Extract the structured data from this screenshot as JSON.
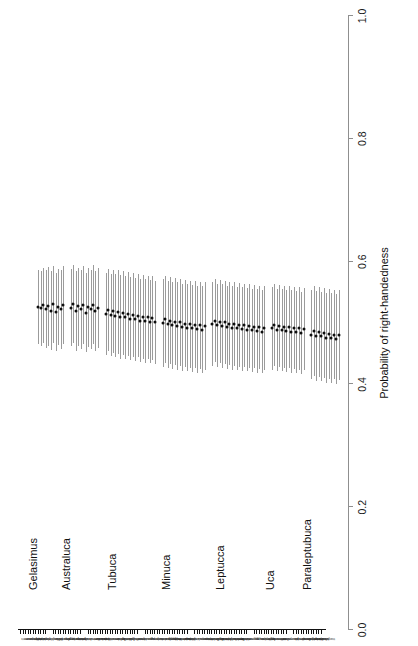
{
  "figure": {
    "type": "forest-plot",
    "orientation": "rotated-90"
  },
  "chart_data": {
    "type": "scatter",
    "title": "",
    "subtitle": "",
    "xlabel": "Probability of right-handedness",
    "ylabel": "",
    "xlim": [
      0.0,
      1.0
    ],
    "xticks": [
      "0.0",
      "0.2",
      "0.4",
      "0.6",
      "0.8",
      "1.0"
    ],
    "xtickvalues": [
      0.0,
      0.2,
      0.4,
      0.6,
      0.8,
      1.0
    ],
    "grid": false,
    "legend": null,
    "reference_line": null,
    "point_color": "#0d0d0d",
    "errorbar_color": "#9b9b9b",
    "axis_color": "#8f8f8f",
    "marker": "point-estimate-with-credible-interval",
    "n_species": 110,
    "groups": [
      {
        "name": "Gelasimus",
        "n": 11,
        "species": [
          {
            "label": "vomeris",
            "value": 0.5,
            "low": 0.44,
            "high": 0.56
          },
          {
            "label": "vocans",
            "value": 0.498,
            "low": 0.437,
            "high": 0.559
          },
          {
            "label": "tetragonon",
            "value": 0.503,
            "low": 0.441,
            "high": 0.564
          },
          {
            "label": "hesperiae",
            "value": 0.497,
            "low": 0.433,
            "high": 0.56
          },
          {
            "label": "jocelynae",
            "value": 0.501,
            "low": 0.436,
            "high": 0.565
          },
          {
            "label": "dampieri",
            "value": 0.494,
            "low": 0.43,
            "high": 0.558
          },
          {
            "label": "borealis",
            "value": 0.505,
            "low": 0.442,
            "high": 0.567
          },
          {
            "label": "excisa",
            "value": 0.492,
            "low": 0.428,
            "high": 0.556
          },
          {
            "label": "elegans",
            "value": 0.5,
            "low": 0.438,
            "high": 0.562
          },
          {
            "label": "neocultrimana",
            "value": 0.496,
            "low": 0.431,
            "high": 0.56
          },
          {
            "label": "longidigita",
            "value": 0.503,
            "low": 0.439,
            "high": 0.566
          }
        ]
      },
      {
        "name": "Australuca",
        "n": 12,
        "species": [
          {
            "label": "bellator",
            "value": 0.499,
            "low": 0.436,
            "high": 0.562
          },
          {
            "label": "polita",
            "value": 0.505,
            "low": 0.441,
            "high": 0.569
          },
          {
            "label": "seismella",
            "value": 0.494,
            "low": 0.429,
            "high": 0.558
          },
          {
            "label": "elegans",
            "value": 0.501,
            "low": 0.437,
            "high": 0.564
          },
          {
            "label": "perplexa",
            "value": 0.497,
            "low": 0.432,
            "high": 0.561
          },
          {
            "label": "signata",
            "value": 0.503,
            "low": 0.44,
            "high": 0.566
          },
          {
            "label": "mjoebergi",
            "value": 0.491,
            "low": 0.426,
            "high": 0.556
          },
          {
            "label": "hirsutimanus",
            "value": 0.5,
            "low": 0.435,
            "high": 0.564
          },
          {
            "label": "crassipes",
            "value": 0.496,
            "low": 0.431,
            "high": 0.561
          },
          {
            "label": "tomentosa",
            "value": 0.504,
            "low": 0.439,
            "high": 0.568
          },
          {
            "label": "triangularis",
            "value": 0.493,
            "low": 0.428,
            "high": 0.558
          },
          {
            "label": "annulipes",
            "value": 0.499,
            "low": 0.434,
            "high": 0.563
          }
        ]
      },
      {
        "name": "Tubuca",
        "n": 21,
        "species": [
          {
            "label": "flammula",
            "value": 0.489,
            "low": 0.422,
            "high": 0.556
          },
          {
            "label": "paradussumieri",
            "value": 0.495,
            "low": 0.428,
            "high": 0.562
          },
          {
            "label": "dussumieri",
            "value": 0.487,
            "low": 0.42,
            "high": 0.554
          },
          {
            "label": "acuta",
            "value": 0.493,
            "low": 0.425,
            "high": 0.561
          },
          {
            "label": "arcuata",
            "value": 0.486,
            "low": 0.418,
            "high": 0.554
          },
          {
            "label": "forcipata",
            "value": 0.492,
            "low": 0.424,
            "high": 0.56
          },
          {
            "label": "rosea",
            "value": 0.484,
            "low": 0.416,
            "high": 0.552
          },
          {
            "label": "urvillei",
            "value": 0.49,
            "low": 0.422,
            "high": 0.558
          },
          {
            "label": "coarctata",
            "value": 0.483,
            "low": 0.415,
            "high": 0.551
          },
          {
            "label": "demani",
            "value": 0.489,
            "low": 0.421,
            "high": 0.557
          },
          {
            "label": "capricornis",
            "value": 0.481,
            "low": 0.413,
            "high": 0.549
          },
          {
            "label": "bellator",
            "value": 0.487,
            "low": 0.419,
            "high": 0.555
          },
          {
            "label": "elegans",
            "value": 0.48,
            "low": 0.412,
            "high": 0.548
          },
          {
            "label": "australiae",
            "value": 0.486,
            "low": 0.418,
            "high": 0.554
          },
          {
            "label": "alcocki",
            "value": 0.478,
            "low": 0.41,
            "high": 0.546
          },
          {
            "label": "typhoni",
            "value": 0.484,
            "low": 0.416,
            "high": 0.552
          },
          {
            "label": "polita",
            "value": 0.477,
            "low": 0.409,
            "high": 0.545
          },
          {
            "label": "hirsutimana",
            "value": 0.483,
            "low": 0.415,
            "high": 0.551
          },
          {
            "label": "paradussumieri2",
            "value": 0.476,
            "low": 0.408,
            "high": 0.544
          },
          {
            "label": "seismella",
            "value": 0.482,
            "low": 0.414,
            "high": 0.55
          },
          {
            "label": "signata",
            "value": 0.475,
            "low": 0.407,
            "high": 0.543
          }
        ]
      },
      {
        "name": "Minuca",
        "n": 18,
        "species": [
          {
            "label": "pugnax",
            "value": 0.474,
            "low": 0.403,
            "high": 0.545
          },
          {
            "label": "rapax",
            "value": 0.48,
            "low": 0.409,
            "high": 0.551
          },
          {
            "label": "minax",
            "value": 0.472,
            "low": 0.401,
            "high": 0.543
          },
          {
            "label": "burgersi",
            "value": 0.478,
            "low": 0.407,
            "high": 0.549
          },
          {
            "label": "mordax",
            "value": 0.47,
            "low": 0.399,
            "high": 0.541
          },
          {
            "label": "vocator",
            "value": 0.476,
            "low": 0.405,
            "high": 0.547
          },
          {
            "label": "panacea",
            "value": 0.469,
            "low": 0.398,
            "high": 0.54
          },
          {
            "label": "longisignalis",
            "value": 0.475,
            "low": 0.404,
            "high": 0.546
          },
          {
            "label": "pugilator",
            "value": 0.467,
            "low": 0.396,
            "high": 0.538
          },
          {
            "label": "marguerita",
            "value": 0.473,
            "low": 0.402,
            "high": 0.544
          },
          {
            "label": "brevifrons",
            "value": 0.466,
            "low": 0.395,
            "high": 0.537
          },
          {
            "label": "thayeri",
            "value": 0.472,
            "low": 0.401,
            "high": 0.543
          },
          {
            "label": "ecuadoriensis",
            "value": 0.465,
            "low": 0.394,
            "high": 0.536
          },
          {
            "label": "herradurensis",
            "value": 0.471,
            "low": 0.4,
            "high": 0.542
          },
          {
            "label": "galapagensis",
            "value": 0.464,
            "low": 0.393,
            "high": 0.535
          },
          {
            "label": "zacae",
            "value": 0.47,
            "low": 0.399,
            "high": 0.541
          },
          {
            "label": "victoriana",
            "value": 0.463,
            "low": 0.392,
            "high": 0.534
          },
          {
            "label": "umbratila",
            "value": 0.469,
            "low": 0.398,
            "high": 0.54
          }
        ]
      },
      {
        "name": "Leptucca",
        "n": 22,
        "species": [
          {
            "label": "crenulata",
            "value": 0.472,
            "low": 0.404,
            "high": 0.54
          },
          {
            "label": "speciosa",
            "value": 0.478,
            "low": 0.41,
            "high": 0.546
          },
          {
            "label": "spinicarpa",
            "value": 0.47,
            "low": 0.402,
            "high": 0.538
          },
          {
            "label": "latimanus",
            "value": 0.476,
            "low": 0.408,
            "high": 0.544
          },
          {
            "label": "festae",
            "value": 0.469,
            "low": 0.401,
            "high": 0.537
          },
          {
            "label": "batuenta",
            "value": 0.475,
            "low": 0.407,
            "high": 0.543
          },
          {
            "label": "deichmanni",
            "value": 0.467,
            "low": 0.399,
            "high": 0.535
          },
          {
            "label": "dorotheae",
            "value": 0.473,
            "low": 0.405,
            "high": 0.541
          },
          {
            "label": "inaequalis",
            "value": 0.466,
            "low": 0.398,
            "high": 0.534
          },
          {
            "label": "leptodactyla",
            "value": 0.472,
            "low": 0.404,
            "high": 0.54
          },
          {
            "label": "limicola",
            "value": 0.465,
            "low": 0.397,
            "high": 0.533
          },
          {
            "label": "oerstedi",
            "value": 0.471,
            "low": 0.403,
            "high": 0.539
          },
          {
            "label": "saltitanta",
            "value": 0.464,
            "low": 0.396,
            "high": 0.532
          },
          {
            "label": "stenodactylus",
            "value": 0.47,
            "low": 0.402,
            "high": 0.538
          },
          {
            "label": "terpsichores",
            "value": 0.463,
            "low": 0.395,
            "high": 0.531
          },
          {
            "label": "tomentosa",
            "value": 0.469,
            "low": 0.401,
            "high": 0.537
          },
          {
            "label": "beebei",
            "value": 0.462,
            "low": 0.394,
            "high": 0.53
          },
          {
            "label": "coloradensis",
            "value": 0.468,
            "low": 0.4,
            "high": 0.536
          },
          {
            "label": "helleri",
            "value": 0.461,
            "low": 0.393,
            "high": 0.529
          },
          {
            "label": "musica",
            "value": 0.467,
            "low": 0.399,
            "high": 0.535
          },
          {
            "label": "panamensis",
            "value": 0.46,
            "low": 0.392,
            "high": 0.528
          },
          {
            "label": "pygmaea",
            "value": 0.466,
            "low": 0.398,
            "high": 0.534
          }
        ]
      },
      {
        "name": "Uca",
        "n": 14,
        "species": [
          {
            "label": "princeps",
            "value": 0.465,
            "low": 0.398,
            "high": 0.532
          },
          {
            "label": "major",
            "value": 0.471,
            "low": 0.404,
            "high": 0.538
          },
          {
            "label": "heteropleura",
            "value": 0.463,
            "low": 0.396,
            "high": 0.53
          },
          {
            "label": "ornata",
            "value": 0.469,
            "low": 0.402,
            "high": 0.536
          },
          {
            "label": "stylifera",
            "value": 0.462,
            "low": 0.395,
            "high": 0.529
          },
          {
            "label": "tangeri",
            "value": 0.468,
            "low": 0.401,
            "high": 0.535
          },
          {
            "label": "insignis",
            "value": 0.461,
            "low": 0.394,
            "high": 0.528
          },
          {
            "label": "intermedia",
            "value": 0.467,
            "low": 0.4,
            "high": 0.534
          },
          {
            "label": "maracoani",
            "value": 0.46,
            "low": 0.393,
            "high": 0.527
          },
          {
            "label": "monilifera",
            "value": 0.466,
            "low": 0.399,
            "high": 0.533
          },
          {
            "label": "virens",
            "value": 0.459,
            "low": 0.392,
            "high": 0.526
          },
          {
            "label": "vocator",
            "value": 0.465,
            "low": 0.398,
            "high": 0.532
          },
          {
            "label": "panamensis",
            "value": 0.458,
            "low": 0.391,
            "high": 0.525
          },
          {
            "label": "princeps2",
            "value": 0.464,
            "low": 0.397,
            "high": 0.531
          }
        ]
      },
      {
        "name": "Paraleptubuca",
        "n": 12,
        "species": [
          {
            "label": "splendida",
            "value": 0.455,
            "low": 0.382,
            "high": 0.528
          },
          {
            "label": "sindensis",
            "value": 0.461,
            "low": 0.388,
            "high": 0.534
          },
          {
            "label": "marcuseni",
            "value": 0.453,
            "low": 0.38,
            "high": 0.526
          },
          {
            "label": "inversa",
            "value": 0.459,
            "low": 0.386,
            "high": 0.532
          },
          {
            "label": "chlorophthalmus",
            "value": 0.452,
            "low": 0.379,
            "high": 0.525
          },
          {
            "label": "tenuipedis",
            "value": 0.458,
            "low": 0.385,
            "high": 0.531
          },
          {
            "label": "bengali",
            "value": 0.45,
            "low": 0.377,
            "high": 0.523
          },
          {
            "label": "crassipes",
            "value": 0.456,
            "low": 0.383,
            "high": 0.529
          },
          {
            "label": "hirsutimanus",
            "value": 0.449,
            "low": 0.376,
            "high": 0.522
          },
          {
            "label": "annulipes",
            "value": 0.455,
            "low": 0.382,
            "high": 0.528
          },
          {
            "label": "lactea",
            "value": 0.448,
            "low": 0.375,
            "high": 0.521
          },
          {
            "label": "triangularis",
            "value": 0.454,
            "low": 0.381,
            "high": 0.527
          }
        ]
      }
    ]
  }
}
